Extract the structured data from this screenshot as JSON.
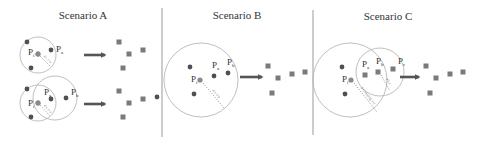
{
  "figure": {
    "width": 485,
    "height": 143,
    "colors": {
      "background": "#ffffff",
      "dot": "#505050",
      "square": "#7a7a7a",
      "circle": "#b8b8b8",
      "arrow": "#555555",
      "separator": "#9a9a9a",
      "text": "#333333"
    },
    "separators": [
      {
        "x": 162,
        "y1": 8,
        "y2": 137
      },
      {
        "x": 313,
        "y1": 10,
        "y2": 135
      }
    ]
  },
  "scenarios": [
    {
      "id": "A",
      "title": "Scenario A",
      "title_pos": [
        83,
        19
      ],
      "rows": [
        {
          "circles": [
            {
              "cx": 38,
              "cy": 55,
              "r": 18
            }
          ],
          "dots": [
            [
              27,
              42
            ],
            [
              51,
              50
            ],
            [
              31,
              68
            ],
            [
              38,
              54
            ]
          ],
          "highlight_point": [
            38,
            54
          ],
          "labels": [
            {
              "text": "P",
              "sub": "i",
              "x": 28,
              "y": 55
            },
            {
              "text": "P",
              "sub": "a",
              "x": 56,
              "y": 52
            }
          ],
          "dotted": {
            "x1": 40,
            "y1": 56,
            "x2": 50,
            "y2": 66,
            "label": "d i, i+a"
          },
          "arrow": {
            "x1": 84,
            "x2": 108,
            "y": 55
          },
          "squares": [
            [
              119,
              42
            ],
            [
              129,
              54
            ],
            [
              143,
              50
            ],
            [
              123,
              68
            ]
          ],
          "extra_dots": []
        },
        {
          "circles": [
            {
              "cx": 38,
              "cy": 103,
              "r": 18
            },
            {
              "cx": 55,
              "cy": 98,
              "r": 22
            }
          ],
          "dots": [
            [
              27,
              89
            ],
            [
              51,
              99
            ],
            [
              31,
              117
            ],
            [
              66,
              98
            ],
            [
              38,
              103
            ]
          ],
          "highlight_point": [
            38,
            103
          ],
          "labels": [
            {
              "text": "P",
              "sub": "i",
              "x": 28,
              "y": 106
            },
            {
              "text": "P",
              "sub": "a",
              "x": 44,
              "y": 95
            },
            {
              "text": "P",
              "sub": "b",
              "x": 71,
              "y": 95
            }
          ],
          "dotted": {
            "x1": 40,
            "y1": 105,
            "x2": 50,
            "y2": 116,
            "label": "d i, i+a"
          },
          "arrow": {
            "x1": 84,
            "x2": 108,
            "y": 104
          },
          "squares": [
            [
              119,
              91
            ],
            [
              129,
              103
            ],
            [
              143,
              99
            ],
            [
              123,
              117
            ]
          ],
          "extra_dots": [
            [
              157,
              97
            ]
          ]
        }
      ]
    },
    {
      "id": "B",
      "title": "Scenario B",
      "title_pos": [
        237,
        19
      ],
      "rows": [
        {
          "circles": [
            {
              "cx": 201,
              "cy": 80,
              "r": 37
            }
          ],
          "dots": [
            [
              190,
              67
            ],
            [
              214,
              76
            ],
            [
              228,
              73
            ],
            [
              194,
              94
            ]
          ],
          "highlight_point": [
            200,
            80
          ],
          "labels": [
            {
              "text": "P",
              "sub": "i",
              "x": 191,
              "y": 82
            },
            {
              "text": "P",
              "sub": "a",
              "x": 212,
              "y": 68
            },
            {
              "text": "P",
              "sub": "b",
              "x": 227,
              "y": 65
            }
          ],
          "dotted": {
            "x1": 203,
            "y1": 83,
            "x2": 224,
            "y2": 108,
            "label": "d i, i+b"
          },
          "arrow": {
            "x1": 240,
            "x2": 265,
            "y": 77
          },
          "squares": [
            [
              268,
              66
            ],
            [
              278,
              78
            ],
            [
              292,
              74
            ],
            [
              305,
              72
            ],
            [
              272,
              93
            ]
          ],
          "extra_dots": []
        }
      ]
    },
    {
      "id": "C",
      "title": "Scenario C",
      "title_pos": [
        388,
        20
      ],
      "rows": [
        {
          "circles": [
            {
              "cx": 350,
              "cy": 80,
              "r": 37
            },
            {
              "cx": 380,
              "cy": 72,
              "r": 24
            }
          ],
          "dots": [
            [
              342,
              67
            ],
            [
              345,
              94
            ]
          ],
          "highlight_point": [
            351,
            80
          ],
          "inner_squares": [
            [
              365,
              75
            ],
            [
              378,
              72
            ],
            [
              393,
              69
            ]
          ],
          "labels": [
            {
              "text": "P",
              "sub": "i",
              "x": 342,
              "y": 82
            },
            {
              "text": "P",
              "sub": "a",
              "x": 362,
              "y": 67
            },
            {
              "text": "P",
              "sub": "b",
              "x": 376,
              "y": 64
            },
            {
              "text": "P",
              "sub": "c",
              "x": 398,
              "y": 64
            }
          ],
          "dotted": {
            "x1": 354,
            "y1": 83,
            "x2": 377,
            "y2": 112,
            "label": "d i,missing, i+c"
          },
          "dotted2": {
            "x1": 381,
            "y1": 75,
            "x2": 390,
            "y2": 91,
            "label": "d b,c"
          },
          "arrow": {
            "x1": 400,
            "x2": 422,
            "y": 77
          },
          "squares": [
            [
              426,
              66
            ],
            [
              436,
              78
            ],
            [
              450,
              74
            ],
            [
              463,
              72
            ],
            [
              430,
              93
            ]
          ],
          "extra_dots": []
        }
      ]
    }
  ]
}
